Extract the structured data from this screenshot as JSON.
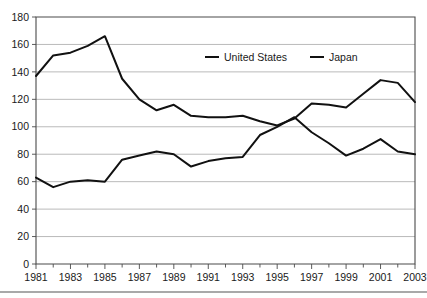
{
  "chart_data": {
    "type": "line",
    "title": "",
    "subtitle": "",
    "xlabel": "",
    "ylabel": "",
    "x": [
      1981,
      1982,
      1983,
      1984,
      1985,
      1986,
      1987,
      1988,
      1989,
      1990,
      1991,
      1992,
      1993,
      1994,
      1995,
      1996,
      1997,
      1998,
      1999,
      2000,
      2001,
      2002,
      2003
    ],
    "categories": [
      "1981",
      "1982",
      "1983",
      "1984",
      "1985",
      "1986",
      "1987",
      "1988",
      "1989",
      "1990",
      "1991",
      "1992",
      "1993",
      "1994",
      "1995",
      "1996",
      "1997",
      "1998",
      "1999",
      "2000",
      "2001",
      "2002",
      "2003"
    ],
    "series": [
      {
        "name": "United States",
        "values": [
          137,
          152,
          154,
          159,
          166,
          135,
          120,
          112,
          116,
          108,
          107,
          107,
          108,
          104,
          101,
          106,
          117,
          116,
          114,
          124,
          134,
          132,
          118
        ]
      },
      {
        "name": "Japan",
        "values": [
          63,
          56,
          60,
          61,
          60,
          76,
          79,
          82,
          80,
          71,
          75,
          77,
          78,
          94,
          100,
          107,
          96,
          88,
          79,
          84,
          91,
          82,
          80
        ]
      }
    ],
    "ylim": [
      0,
      180
    ],
    "ytick_values": [
      0,
      20,
      40,
      60,
      80,
      100,
      120,
      140,
      160,
      180
    ],
    "ytick_labels": [
      "0",
      "20",
      "40",
      "60",
      "80",
      "100",
      "120",
      "140",
      "160",
      "180"
    ],
    "xtick_labels": [
      "1981",
      "1983",
      "1985",
      "1987",
      "1989",
      "1991",
      "1993",
      "1995",
      "1997",
      "1999",
      "2001",
      "2003"
    ],
    "xtick_values": [
      1981,
      1983,
      1985,
      1987,
      1989,
      1991,
      1993,
      1995,
      1997,
      1999,
      2001,
      2003
    ],
    "xlim": [
      1981,
      2003
    ],
    "grid": true,
    "grid_axis": "y",
    "legend_position": "top-center-inside",
    "legend": [
      "United States",
      "Japan"
    ],
    "colors": {
      "series_line": "#111111",
      "gridline": "#a8a8a8",
      "axis": "#4a4a4a",
      "text": "#1a1a1a",
      "background": "#ffffff"
    }
  }
}
